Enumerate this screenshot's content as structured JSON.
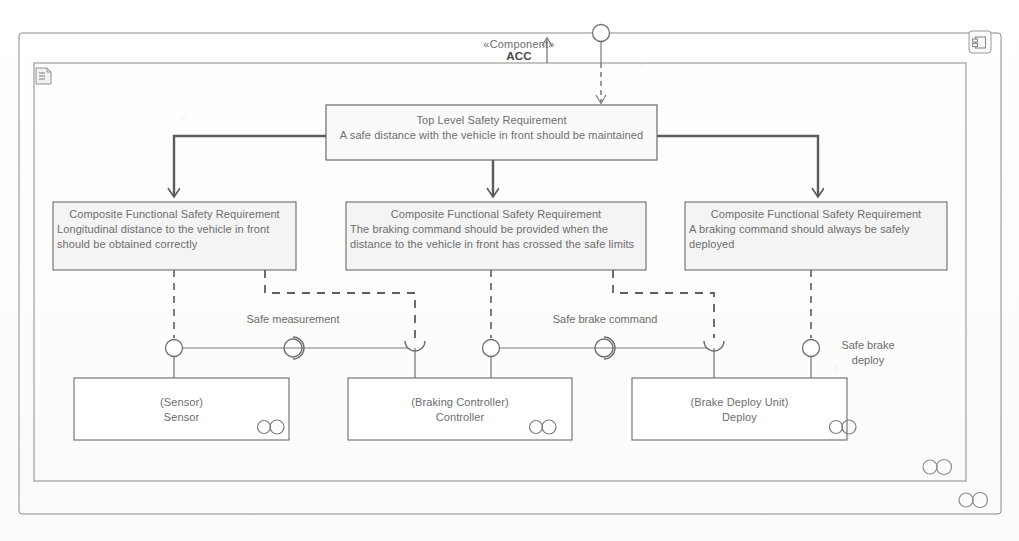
{
  "diagram": {
    "type": "UML Composite Structure / Component Diagram",
    "header": {
      "stereotype": "«Component»",
      "name": "ACC"
    },
    "outer_frame": {
      "corner_icon": "component-icon",
      "bottom_icon": "component-icon"
    },
    "inner_frame": {
      "corner_icon": "note-icon",
      "bottom_icon": "component-icon"
    }
  },
  "requirements": {
    "top": {
      "title": "Top Level Safety Requirement",
      "body": "A safe distance with the vehicle in front should be maintained"
    },
    "composites": [
      {
        "title": "Composite Functional Safety Requirement",
        "line1": "Longitudinal distance to the vehicle in front",
        "line2": "should be obtained correctly"
      },
      {
        "title": "Composite Functional Safety Requirement",
        "line1": "The braking command should be provided when the",
        "line2": "distance to the vehicle in front has crossed the safe limits"
      },
      {
        "title": "Composite Functional Safety Requirement",
        "line1": "A braking command should always be safely",
        "line2": "deployed"
      }
    ]
  },
  "parts": [
    {
      "type_label": "(Sensor)",
      "name": "Sensor",
      "icon": "component-icon"
    },
    {
      "type_label": "(Braking Controller)",
      "name": "Controller",
      "icon": "component-icon"
    },
    {
      "type_label": "(Brake Deploy Unit)",
      "name": "Deploy",
      "icon": "component-icon"
    }
  ],
  "interfaces": [
    {
      "name": "Safe measurement"
    },
    {
      "name": "Safe brake command"
    },
    {
      "name_line1": "Safe brake",
      "name_line2": "deploy"
    }
  ],
  "colors": {
    "stroke": "#6f6f6f",
    "stroke_dark": "#4a4a4a",
    "text": "#6d6d6d",
    "background": "#ffffff"
  }
}
